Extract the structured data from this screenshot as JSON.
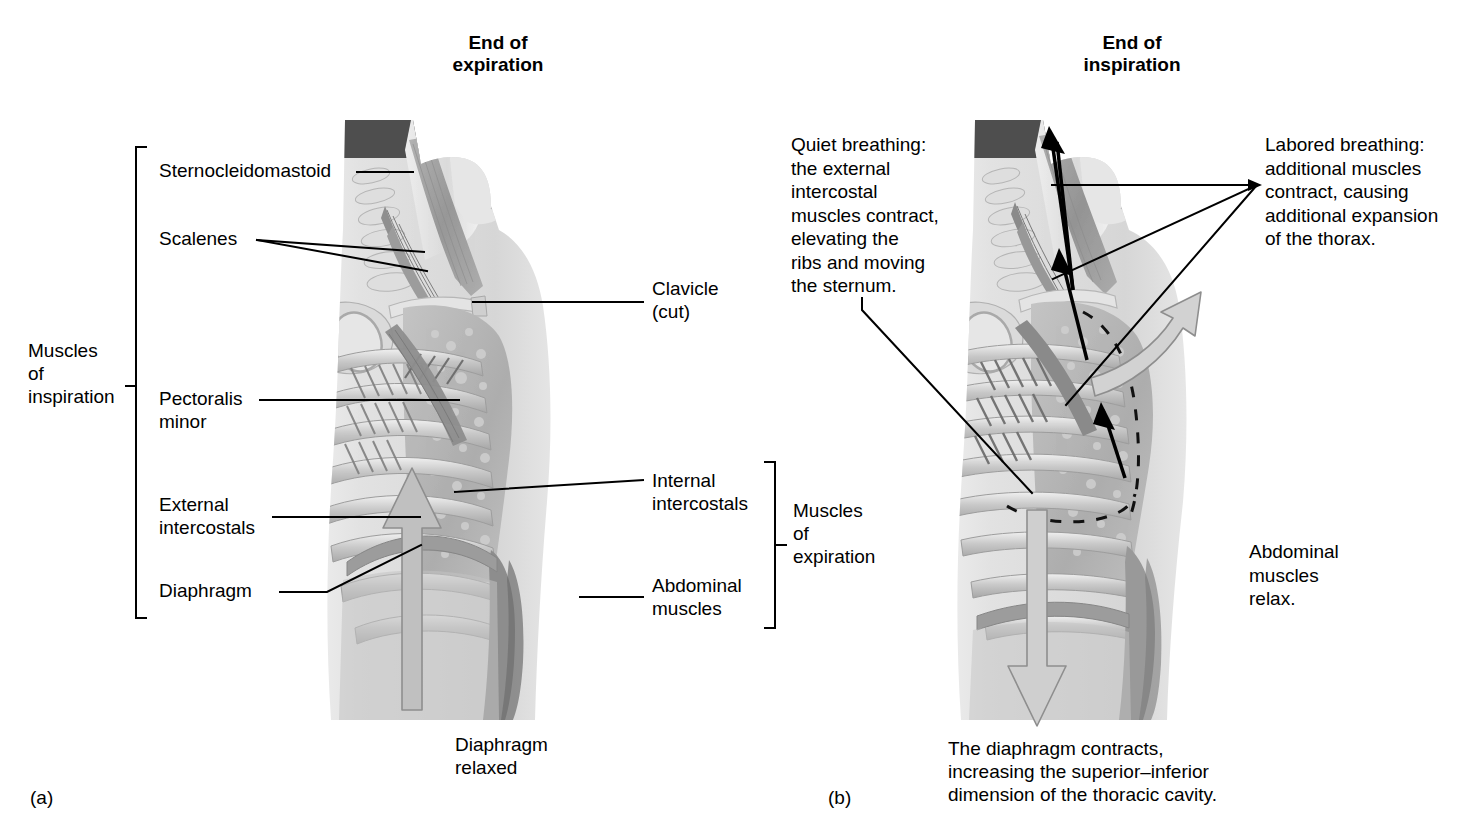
{
  "figure": {
    "panels": [
      {
        "letter": "(a)",
        "heading": "End of\nexpiration",
        "group_label": "Muscles\nof\ninspiration",
        "left_labels": [
          "Sternocleidomastoid",
          "Scalenes",
          "Pectoralis\nminor",
          "External\nintercostals",
          "Diaphragm"
        ],
        "right_labels": [
          "Clavicle\n(cut)",
          "Internal\nintercostals",
          "Abdominal\nmuscles"
        ],
        "right_group_label": "Muscles\nof\nexpiration",
        "caption": "Diaphragm\nrelaxed"
      },
      {
        "letter": "(b)",
        "heading": "End of\ninspiration",
        "note_left": "Quiet breathing:\nthe external\nintercostal\nmuscles contract,\nelevating the\nribs and moving\nthe sternum.",
        "note_right": "Labored breathing:\nadditional muscles\ncontract, causing\nadditional expansion\nof the thorax.",
        "note_abdominal": "Abdominal\nmuscles\nrelax.",
        "caption": "The diaphragm contracts,\nincreasing the superior–inferior\ndimension of the thoracic cavity."
      }
    ],
    "colors": {
      "ink": "#000000",
      "background": "#ffffff",
      "arrow_fill": "#b9b9b9",
      "arrow_stroke": "#8f8f8f",
      "skin_light": "#e9e9e9",
      "skin_mid": "#cfcfcf",
      "muscle": "#9a9a9a",
      "bone": "#dcdcdc",
      "dark": "#4a4a4a"
    }
  }
}
